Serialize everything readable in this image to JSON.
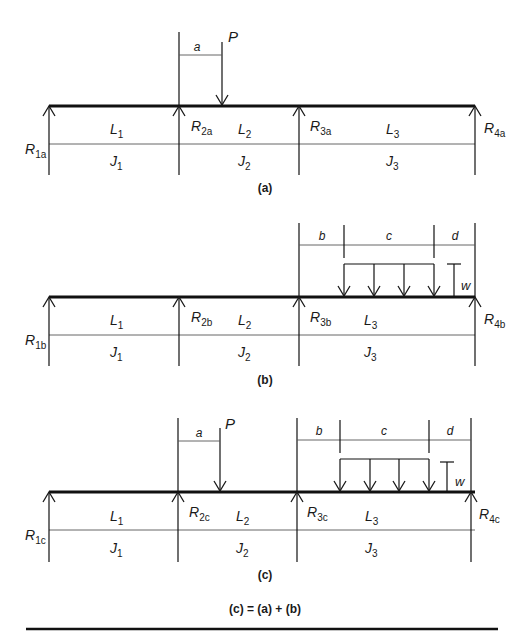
{
  "figure": {
    "panels": {
      "a": {
        "caption": "(a)",
        "reactions": [
          "R",
          "R",
          "R",
          "R"
        ],
        "reaction_subs": [
          "1a",
          "2a",
          "3a",
          "4a"
        ],
        "spans": [
          "L",
          "L",
          "L"
        ],
        "span_subs": [
          "1",
          "2",
          "3"
        ],
        "inertias": [
          "J",
          "J",
          "J"
        ],
        "inertia_subs": [
          "1",
          "2",
          "3"
        ],
        "point_load": "P",
        "dim_a": "a"
      },
      "b": {
        "caption": "(b)",
        "reactions": [
          "R",
          "R",
          "R",
          "R"
        ],
        "reaction_subs": [
          "1b",
          "2b",
          "3b",
          "4b"
        ],
        "spans": [
          "L",
          "L",
          "L"
        ],
        "span_subs": [
          "1",
          "2",
          "3"
        ],
        "inertias": [
          "J",
          "J",
          "J"
        ],
        "inertia_subs": [
          "1",
          "2",
          "3"
        ],
        "dim_b": "b",
        "dim_c": "c",
        "dim_d": "d",
        "udl": "w"
      },
      "c": {
        "caption": "(c)",
        "reactions": [
          "R",
          "R",
          "R",
          "R"
        ],
        "reaction_subs": [
          "1c",
          "2c",
          "3c",
          "4c"
        ],
        "spans": [
          "L",
          "L",
          "L"
        ],
        "span_subs": [
          "1",
          "2",
          "3"
        ],
        "inertias": [
          "J",
          "J",
          "J"
        ],
        "inertia_subs": [
          "1",
          "2",
          "3"
        ],
        "point_load": "P",
        "dim_a": "a",
        "dim_b": "b",
        "dim_c": "c",
        "dim_d": "d",
        "udl": "w"
      }
    },
    "equation": "(c) = (a) + (b)"
  }
}
